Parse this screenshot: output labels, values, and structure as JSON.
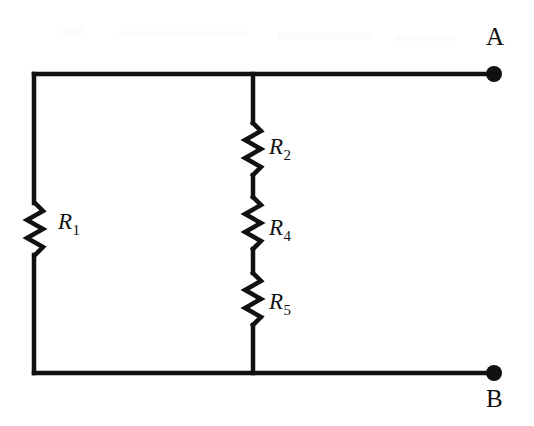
{
  "figure": {
    "kind": "electrical-circuit-schematic",
    "background_color": "#ffffff",
    "stroke_color": "#111111",
    "width": 534,
    "height": 426
  },
  "terminals": [
    {
      "id": "A",
      "label": "A",
      "label_position": "above",
      "dot_x": 494,
      "dot_y": 74,
      "dot_radius": 8
    },
    {
      "id": "B",
      "label": "B",
      "label_position": "below",
      "dot_x": 494,
      "dot_y": 373,
      "dot_radius": 8
    }
  ],
  "resistors": [
    {
      "id": "R1",
      "label_r": "R",
      "label_sub": "1",
      "branch": "left",
      "orientation": "vertical",
      "x": 35,
      "y_start": 202,
      "y_end": 256
    },
    {
      "id": "R2",
      "label_r": "R",
      "label_sub": "2",
      "branch": "middle",
      "orientation": "vertical",
      "x": 253,
      "y_start": 122,
      "y_end": 176
    },
    {
      "id": "R4",
      "label_r": "R",
      "label_sub": "4",
      "branch": "middle",
      "orientation": "vertical",
      "x": 253,
      "y_start": 196,
      "y_end": 250
    },
    {
      "id": "R5",
      "label_r": "R",
      "label_sub": "5",
      "branch": "middle",
      "orientation": "vertical",
      "x": 253,
      "y_start": 272,
      "y_end": 326
    }
  ],
  "wires": {
    "top_rail": {
      "x1": 34,
      "y1": 74,
      "x2": 494,
      "y2": 74
    },
    "bottom_rail": {
      "x1": 34,
      "y1": 373,
      "x2": 494,
      "y2": 373
    },
    "left_branch_upper": {
      "x1": 34,
      "y1": 74,
      "x2": 34,
      "y2": 202
    },
    "left_branch_lower": {
      "x1": 34,
      "y1": 256,
      "x2": 34,
      "y2": 373
    },
    "middle_branch_upper": {
      "x1": 253,
      "y1": 74,
      "x2": 253,
      "y2": 122
    },
    "middle_branch_mid_a": {
      "x1": 253,
      "y1": 176,
      "x2": 253,
      "y2": 196
    },
    "middle_branch_mid_b": {
      "x1": 253,
      "y1": 250,
      "x2": 253,
      "y2": 272
    },
    "middle_branch_lower": {
      "x1": 253,
      "y1": 326,
      "x2": 253,
      "y2": 373
    }
  },
  "junctions": [
    {
      "id": "top-middle-node",
      "x": 253,
      "y": 74
    },
    {
      "id": "bottom-middle-node",
      "x": 253,
      "y": 373
    }
  ]
}
